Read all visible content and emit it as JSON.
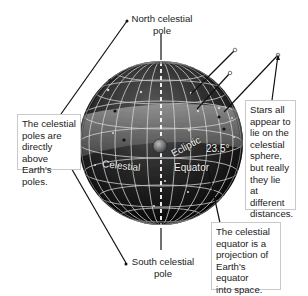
{
  "title": "Celestial sphere",
  "labels": {
    "north_pole": [
      "North celestial",
      "pole"
    ],
    "south_pole": [
      "South celestial",
      "pole"
    ],
    "celestial": "Celestial",
    "equator": "Equator",
    "ecliptic": "Ecliptic",
    "tilt": "23.5°"
  },
  "callouts": {
    "poles": [
      "The celestial",
      "poles are",
      "directly above",
      "Earth's poles."
    ],
    "stars": [
      "Stars all",
      "appear to",
      "lie on the",
      "celestial",
      "sphere,",
      "but really",
      "they lie at",
      "different",
      "distances."
    ],
    "equator": [
      "The celestial",
      "equator is a",
      "projection of",
      "Earth's equator",
      "into space."
    ]
  },
  "colors": {
    "sphere_dark": "#111111",
    "sphere_band": "#6e6e6e",
    "grid": "#d8d8d8",
    "axis": "#ffffff",
    "line": "#222222",
    "box_border": "#c9c9c9"
  }
}
